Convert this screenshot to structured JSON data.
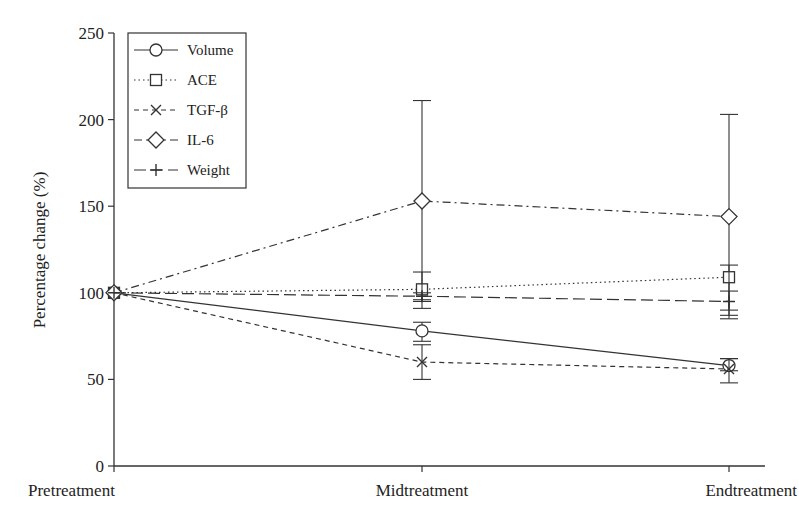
{
  "chart_data": {
    "type": "line",
    "title": "",
    "xlabel": "",
    "ylabel": "Percentage change (%)",
    "ylim": [
      0,
      250
    ],
    "yticks": [
      0,
      50,
      100,
      150,
      200,
      250
    ],
    "categories": [
      "Pretreatment",
      "Midtreatment",
      "Endtreatment"
    ],
    "grid": false,
    "legend_position": "upper-left",
    "series": [
      {
        "name": "Volume",
        "marker": "circle",
        "line": "solid",
        "values": [
          100,
          78,
          58
        ],
        "err_low": [
          100,
          72,
          55
        ],
        "err_high": [
          100,
          83,
          62
        ]
      },
      {
        "name": "ACE",
        "marker": "square",
        "line": "dotted",
        "values": [
          100,
          102,
          109
        ],
        "err_low": [
          100,
          91,
          87
        ],
        "err_high": [
          100,
          112,
          116
        ]
      },
      {
        "name": "TGF-β",
        "marker": "x",
        "line": "dashed",
        "values": [
          100,
          60,
          56
        ],
        "err_low": [
          100,
          50,
          48
        ],
        "err_high": [
          100,
          70,
          62
        ]
      },
      {
        "name": "IL-6",
        "marker": "diamond",
        "line": "dashdot",
        "values": [
          100,
          153,
          144
        ],
        "err_low": [
          100,
          95,
          85
        ],
        "err_high": [
          100,
          211,
          203
        ]
      },
      {
        "name": "Weight",
        "marker": "plus",
        "line": "longdash",
        "values": [
          100,
          98,
          95
        ],
        "err_low": [
          100,
          96,
          90
        ],
        "err_high": [
          100,
          100,
          101
        ]
      }
    ]
  }
}
